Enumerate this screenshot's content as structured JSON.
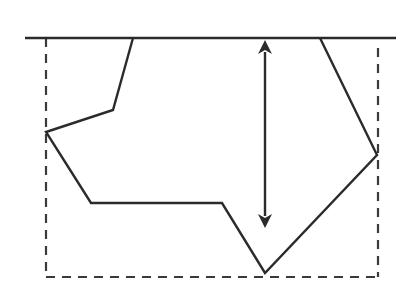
{
  "diagram": {
    "colors": {
      "background": "#ffffff",
      "stroke": "#2b2b2b",
      "dashed": "#3a3a3a"
    },
    "reference_line": {
      "x1": 25,
      "y1": 38,
      "x2": 396,
      "y2": 38
    },
    "bounding_box": {
      "left": 46,
      "top": 38,
      "right": 378,
      "bottom": 277,
      "right_side_top": 48,
      "style": "dashed"
    },
    "polygon_points": [
      [
        133,
        38
      ],
      [
        113,
        110
      ],
      [
        46,
        132
      ],
      [
        91,
        203
      ],
      [
        222,
        203
      ],
      [
        265,
        273
      ],
      [
        377,
        155
      ],
      [
        320,
        38
      ]
    ],
    "depth_arrow": {
      "x": 265,
      "y_top": 40,
      "y_bottom": 228,
      "heads": "both"
    }
  }
}
